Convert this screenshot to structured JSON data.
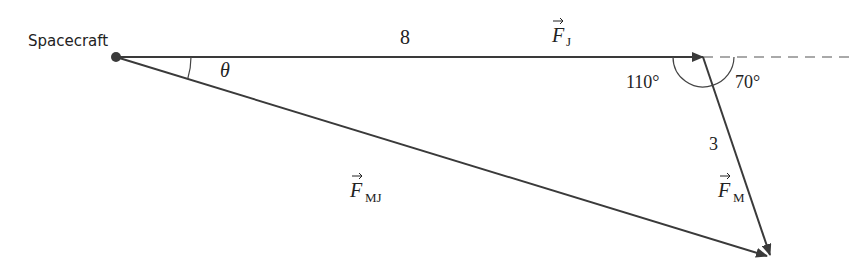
{
  "diagram": {
    "point_label": "Spacecraft",
    "vectors": {
      "fj": {
        "symbol": "F",
        "subscript": "J",
        "magnitude": "8"
      },
      "fm": {
        "symbol": "F",
        "subscript": "M",
        "magnitude": "3"
      },
      "fmj": {
        "symbol": "F",
        "subscript": "MJ"
      }
    },
    "angles": {
      "theta": "θ",
      "interior": "110°",
      "exterior": "70°"
    },
    "colors": {
      "line": "#3a3a3a",
      "text": "#222222",
      "background": "#ffffff"
    }
  }
}
